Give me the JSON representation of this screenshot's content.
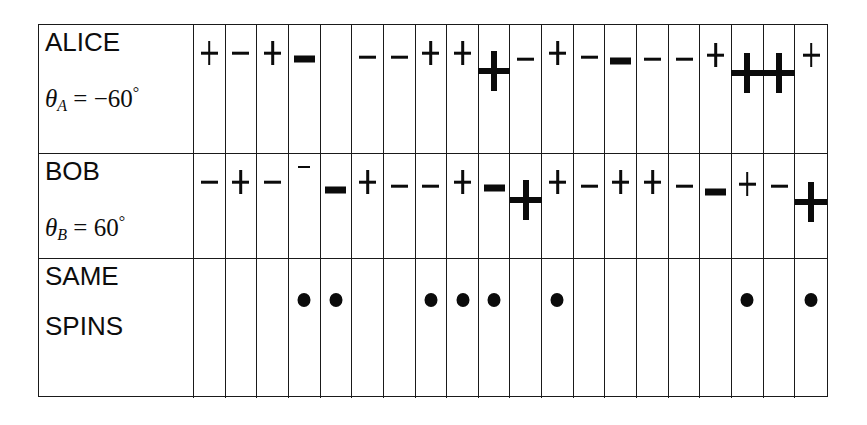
{
  "table": {
    "rows": [
      {
        "id": "alice",
        "name": "ALICE",
        "label_main": "ALICE",
        "angle_symbol": "θ",
        "angle_subscript": "A",
        "angle_equals": " = ",
        "angle_value": "−60",
        "angle_degree": "°",
        "angle_text": "θA = −60°"
      },
      {
        "id": "bob",
        "name": "BOB",
        "label_main": "BOB",
        "angle_symbol": "θ",
        "angle_subscript": "B",
        "angle_equals": " = ",
        "angle_value": "60",
        "angle_degree": "°",
        "angle_text": "θB = 60°"
      },
      {
        "id": "same-spins",
        "name": "SAME SPINS",
        "label_main": "SAME",
        "label_line2": "SPINS"
      }
    ],
    "column_count": 20,
    "alice_spins": [
      {
        "sign": "+",
        "size": "small",
        "offset": 0
      },
      {
        "sign": "-",
        "size": "small",
        "offset": 0
      },
      {
        "sign": "+",
        "size": "small",
        "offset": 0
      },
      {
        "sign": "-",
        "size": "large",
        "offset": 14
      },
      {
        "sign": "",
        "size": "none",
        "offset": 0
      },
      {
        "sign": "-",
        "size": "small",
        "offset": 4
      },
      {
        "sign": "-",
        "size": "small",
        "offset": 4
      },
      {
        "sign": "+",
        "size": "small",
        "offset": 0
      },
      {
        "sign": "+",
        "size": "small",
        "offset": 0
      },
      {
        "sign": "+",
        "size": "xlarge",
        "offset": 10
      },
      {
        "sign": "-",
        "size": "small",
        "offset": 6
      },
      {
        "sign": "+",
        "size": "small",
        "offset": 0
      },
      {
        "sign": "-",
        "size": "small",
        "offset": 4
      },
      {
        "sign": "-",
        "size": "large",
        "offset": 16
      },
      {
        "sign": "-",
        "size": "small",
        "offset": 6
      },
      {
        "sign": "-",
        "size": "small",
        "offset": 6
      },
      {
        "sign": "+",
        "size": "small",
        "offset": 2
      },
      {
        "sign": "+",
        "size": "xlarge",
        "offset": 12
      },
      {
        "sign": "+",
        "size": "xlarge",
        "offset": 12
      },
      {
        "sign": "+",
        "size": "small",
        "offset": 2
      }
    ],
    "alice_spins_extra": [
      {
        "sign": "+",
        "size": "small",
        "offset": 2
      }
    ],
    "bob_spins": [
      {
        "sign": "-",
        "size": "small",
        "offset": 0
      },
      {
        "sign": "+",
        "size": "small",
        "offset": 0
      },
      {
        "sign": "-",
        "size": "small",
        "offset": 0
      },
      {
        "sign": "-",
        "size": "tiny",
        "offset": -4
      },
      {
        "sign": "-",
        "size": "large",
        "offset": 16
      },
      {
        "sign": "+",
        "size": "small",
        "offset": 0
      },
      {
        "sign": "-",
        "size": "small",
        "offset": 4
      },
      {
        "sign": "-",
        "size": "small",
        "offset": 4
      },
      {
        "sign": "+",
        "size": "small",
        "offset": 0
      },
      {
        "sign": "-",
        "size": "large",
        "offset": 14
      },
      {
        "sign": "+",
        "size": "xlarge",
        "offset": 10
      },
      {
        "sign": "+",
        "size": "small",
        "offset": 0
      },
      {
        "sign": "-",
        "size": "small",
        "offset": 4
      },
      {
        "sign": "+",
        "size": "small",
        "offset": 0
      },
      {
        "sign": "+",
        "size": "small",
        "offset": 0
      },
      {
        "sign": "-",
        "size": "small",
        "offset": 4
      },
      {
        "sign": "-",
        "size": "large",
        "offset": 18
      },
      {
        "sign": "+",
        "size": "small",
        "offset": 2
      },
      {
        "sign": "-",
        "size": "small",
        "offset": 4
      },
      {
        "sign": "+",
        "size": "xlarge",
        "offset": 12
      }
    ],
    "same_spins_dots": [
      false,
      false,
      false,
      true,
      true,
      false,
      false,
      true,
      true,
      true,
      false,
      true,
      false,
      false,
      false,
      false,
      false,
      true,
      false,
      true
    ]
  },
  "colors": {
    "ink": "#0b0b0b",
    "border": "#1a1a1a",
    "background": "#ffffff"
  }
}
